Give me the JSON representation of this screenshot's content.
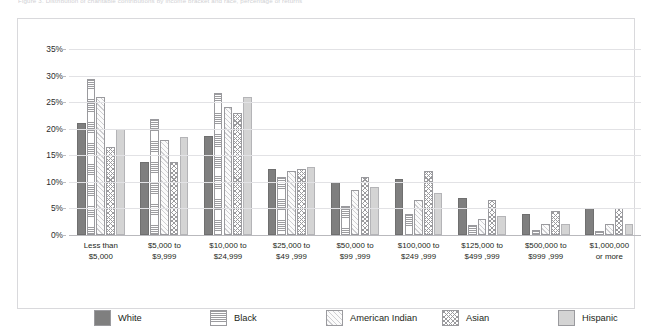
{
  "top_caption": "Figure 3. Distribution of charitable contributions by income bracket and race, percentage of returns",
  "chart_data": {
    "type": "bar",
    "title": "",
    "subtitle": "",
    "xlabel": "",
    "ylabel": "",
    "ylim": [
      0,
      35
    ],
    "ytick_labels": [
      "35%",
      "30%",
      "25%",
      "20%",
      "15%",
      "10%",
      "5%",
      "0%"
    ],
    "ytick_values": [
      35,
      30,
      25,
      20,
      15,
      10,
      5,
      0
    ],
    "grid": true,
    "legend_position": "bottom",
    "categories": [
      "Less than\n$5,000",
      "$5,000 to\n$9,999",
      "$10,000 to\n$24,999",
      "$25,000 to\n$49 ,999",
      "$50,000 to\n$99 ,999",
      "$100,000 to\n$249 ,999",
      "$125,000 to\n$499 ,999",
      "$500,000 to\n$999 ,999",
      "$1,000,000\nor more"
    ],
    "series": [
      {
        "name": "White",
        "pattern": "solid-dark",
        "color": "#7f7f7f",
        "values": [
          21.0,
          13.8,
          18.7,
          12.5,
          10.0,
          10.5,
          7.0,
          4.0,
          5.0
        ]
      },
      {
        "name": "Black",
        "pattern": "horizontal-lines",
        "color": "#ffffff",
        "values": [
          29.3,
          21.8,
          26.8,
          11.0,
          5.5,
          4.0,
          1.8,
          1.0,
          0.8
        ]
      },
      {
        "name": "American Indian",
        "pattern": "diagonal-hatch",
        "color": "#f7f7f7",
        "values": [
          26.0,
          17.8,
          24.0,
          12.0,
          8.5,
          6.5,
          3.0,
          2.0,
          2.0
        ]
      },
      {
        "name": "Asian",
        "pattern": "crosshatch",
        "color": "#ffffff",
        "values": [
          16.5,
          13.8,
          23.0,
          12.5,
          11.0,
          12.0,
          6.5,
          4.5,
          5.0
        ]
      },
      {
        "name": "Hispanic",
        "pattern": "solid-light",
        "color": "#d4d4d4",
        "values": [
          20.0,
          18.5,
          26.0,
          12.8,
          9.0,
          8.0,
          3.5,
          2.0,
          2.0
        ]
      }
    ]
  }
}
